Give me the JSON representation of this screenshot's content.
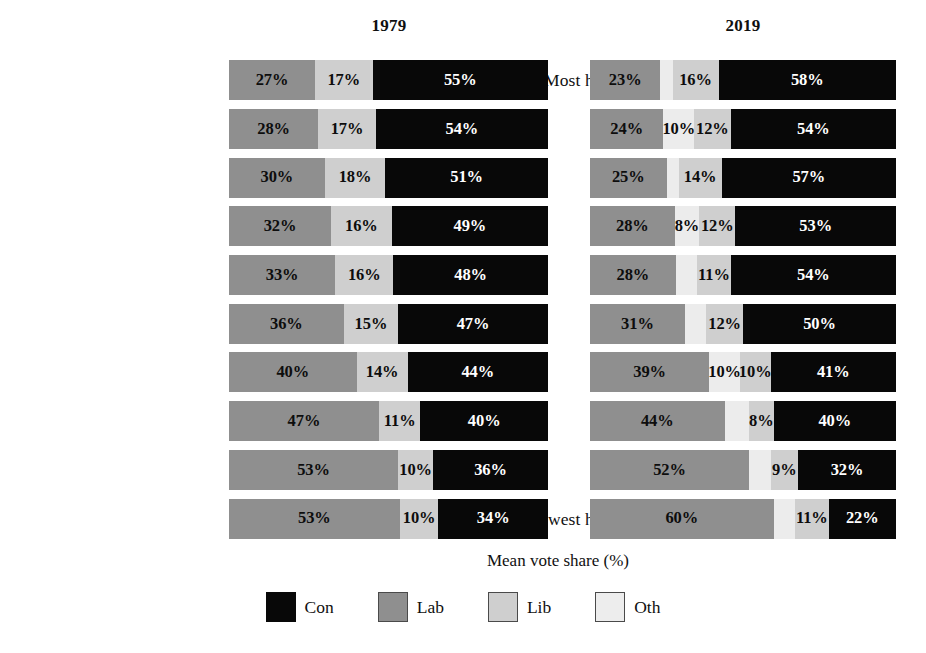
{
  "chart_data": {
    "type": "bar",
    "subtype": "stacked-horizontal-100pct",
    "title": "",
    "xlabel": "Mean vote share (%)",
    "ylabel": "",
    "xlim": [
      0,
      100
    ],
    "grid": false,
    "legend_position": "bottom",
    "panels": [
      {
        "id": "p1979",
        "label": "1979"
      },
      {
        "id": "p2019",
        "label": "2019"
      }
    ],
    "series": [
      {
        "name": "Con",
        "key": "con",
        "color": "#080808"
      },
      {
        "name": "Lab",
        "key": "lab",
        "color": "#8f8f8f"
      },
      {
        "name": "Lib",
        "key": "lib",
        "color": "#cfcfcf"
      },
      {
        "name": "Oth",
        "key": "oth",
        "color": "#ececec"
      }
    ],
    "y_axis_labels": {
      "top": "Most home owners",
      "bottom": "Fewest home owners"
    },
    "categories": [
      "decile 1 (most home owners)",
      "decile 2",
      "decile 3",
      "decile 4",
      "decile 5",
      "decile 6",
      "decile 7",
      "decile 8",
      "decile 9",
      "decile 10 (fewest home owners)"
    ],
    "rows": [
      {
        "row_label": "Most home owners",
        "p1979": [
          {
            "key": "lab",
            "value": 27,
            "label": "27%",
            "width_pct": 27
          },
          {
            "key": "lib",
            "value": 17,
            "label": "17%",
            "width_pct": 18
          },
          {
            "key": "con",
            "value": 55,
            "label": "55%",
            "width_pct": 55
          }
        ],
        "p2019": [
          {
            "key": "lab",
            "value": 23,
            "label": "23%",
            "width_pct": 23
          },
          {
            "key": "oth",
            "value": 3,
            "label": "",
            "width_pct": 4
          },
          {
            "key": "lib",
            "value": 16,
            "label": "16%",
            "width_pct": 15
          },
          {
            "key": "con",
            "value": 58,
            "label": "58%",
            "width_pct": 58
          }
        ]
      },
      {
        "row_label": "",
        "p1979": [
          {
            "key": "lab",
            "value": 28,
            "label": "28%",
            "width_pct": 28
          },
          {
            "key": "lib",
            "value": 17,
            "label": "17%",
            "width_pct": 18
          },
          {
            "key": "con",
            "value": 54,
            "label": "54%",
            "width_pct": 54
          }
        ],
        "p2019": [
          {
            "key": "lab",
            "value": 24,
            "label": "24%",
            "width_pct": 24
          },
          {
            "key": "oth",
            "value": 10,
            "label": "10%",
            "width_pct": 10
          },
          {
            "key": "lib",
            "value": 12,
            "label": "12%",
            "width_pct": 12
          },
          {
            "key": "con",
            "value": 54,
            "label": "54%",
            "width_pct": 54
          }
        ]
      },
      {
        "row_label": "",
        "p1979": [
          {
            "key": "lab",
            "value": 30,
            "label": "30%",
            "width_pct": 30
          },
          {
            "key": "lib",
            "value": 18,
            "label": "18%",
            "width_pct": 19
          },
          {
            "key": "con",
            "value": 51,
            "label": "51%",
            "width_pct": 51
          }
        ],
        "p2019": [
          {
            "key": "lab",
            "value": 25,
            "label": "25%",
            "width_pct": 25
          },
          {
            "key": "oth",
            "value": 4,
            "label": "",
            "width_pct": 4
          },
          {
            "key": "lib",
            "value": 14,
            "label": "14%",
            "width_pct": 14
          },
          {
            "key": "con",
            "value": 57,
            "label": "57%",
            "width_pct": 57
          }
        ]
      },
      {
        "row_label": "",
        "p1979": [
          {
            "key": "lab",
            "value": 32,
            "label": "32%",
            "width_pct": 32
          },
          {
            "key": "lib",
            "value": 16,
            "label": "16%",
            "width_pct": 19
          },
          {
            "key": "con",
            "value": 49,
            "label": "49%",
            "width_pct": 49
          }
        ],
        "p2019": [
          {
            "key": "lab",
            "value": 28,
            "label": "28%",
            "width_pct": 28
          },
          {
            "key": "oth",
            "value": 8,
            "label": "8%",
            "width_pct": 8
          },
          {
            "key": "lib",
            "value": 12,
            "label": "12%",
            "width_pct": 12
          },
          {
            "key": "con",
            "value": 53,
            "label": "53%",
            "width_pct": 53
          }
        ]
      },
      {
        "row_label": "",
        "p1979": [
          {
            "key": "lab",
            "value": 33,
            "label": "33%",
            "width_pct": 33
          },
          {
            "key": "lib",
            "value": 16,
            "label": "16%",
            "width_pct": 18
          },
          {
            "key": "con",
            "value": 48,
            "label": "48%",
            "width_pct": 48
          }
        ],
        "p2019": [
          {
            "key": "lab",
            "value": 28,
            "label": "28%",
            "width_pct": 28
          },
          {
            "key": "oth",
            "value": 7,
            "label": "",
            "width_pct": 7
          },
          {
            "key": "lib",
            "value": 11,
            "label": "11%",
            "width_pct": 11
          },
          {
            "key": "con",
            "value": 54,
            "label": "54%",
            "width_pct": 54
          }
        ]
      },
      {
        "row_label": "",
        "p1979": [
          {
            "key": "lab",
            "value": 36,
            "label": "36%",
            "width_pct": 36
          },
          {
            "key": "lib",
            "value": 15,
            "label": "15%",
            "width_pct": 17
          },
          {
            "key": "con",
            "value": 47,
            "label": "47%",
            "width_pct": 47
          }
        ],
        "p2019": [
          {
            "key": "lab",
            "value": 31,
            "label": "31%",
            "width_pct": 31
          },
          {
            "key": "oth",
            "value": 7,
            "label": "",
            "width_pct": 7
          },
          {
            "key": "lib",
            "value": 12,
            "label": "12%",
            "width_pct": 12
          },
          {
            "key": "con",
            "value": 50,
            "label": "50%",
            "width_pct": 50
          }
        ]
      },
      {
        "row_label": "",
        "p1979": [
          {
            "key": "lab",
            "value": 40,
            "label": "40%",
            "width_pct": 40
          },
          {
            "key": "lib",
            "value": 14,
            "label": "14%",
            "width_pct": 16
          },
          {
            "key": "con",
            "value": 44,
            "label": "44%",
            "width_pct": 44
          }
        ],
        "p2019": [
          {
            "key": "lab",
            "value": 39,
            "label": "39%",
            "width_pct": 39
          },
          {
            "key": "oth",
            "value": 10,
            "label": "10%",
            "width_pct": 10
          },
          {
            "key": "lib",
            "value": 10,
            "label": "10%",
            "width_pct": 10
          },
          {
            "key": "con",
            "value": 41,
            "label": "41%",
            "width_pct": 41
          }
        ]
      },
      {
        "row_label": "",
        "p1979": [
          {
            "key": "lab",
            "value": 47,
            "label": "47%",
            "width_pct": 47
          },
          {
            "key": "lib",
            "value": 11,
            "label": "11%",
            "width_pct": 13
          },
          {
            "key": "con",
            "value": 40,
            "label": "40%",
            "width_pct": 40
          }
        ],
        "p2019": [
          {
            "key": "lab",
            "value": 44,
            "label": "44%",
            "width_pct": 44
          },
          {
            "key": "oth",
            "value": 8,
            "label": "",
            "width_pct": 8
          },
          {
            "key": "lib",
            "value": 8,
            "label": "8%",
            "width_pct": 8
          },
          {
            "key": "con",
            "value": 40,
            "label": "40%",
            "width_pct": 40
          }
        ]
      },
      {
        "row_label": "",
        "p1979": [
          {
            "key": "lab",
            "value": 53,
            "label": "53%",
            "width_pct": 53
          },
          {
            "key": "lib",
            "value": 10,
            "label": "10%",
            "width_pct": 11
          },
          {
            "key": "con",
            "value": 36,
            "label": "36%",
            "width_pct": 36
          }
        ],
        "p2019": [
          {
            "key": "lab",
            "value": 52,
            "label": "52%",
            "width_pct": 52
          },
          {
            "key": "oth",
            "value": 7,
            "label": "",
            "width_pct": 7
          },
          {
            "key": "lib",
            "value": 9,
            "label": "9%",
            "width_pct": 9
          },
          {
            "key": "con",
            "value": 32,
            "label": "32%",
            "width_pct": 32
          }
        ]
      },
      {
        "row_label": "Fewest home owners",
        "p1979": [
          {
            "key": "lab",
            "value": 53,
            "label": "53%",
            "width_pct": 53
          },
          {
            "key": "lib",
            "value": 10,
            "label": "10%",
            "width_pct": 12
          },
          {
            "key": "con",
            "value": 34,
            "label": "34%",
            "width_pct": 34
          }
        ],
        "p2019": [
          {
            "key": "lab",
            "value": 60,
            "label": "60%",
            "width_pct": 60
          },
          {
            "key": "oth",
            "value": 7,
            "label": "",
            "width_pct": 7
          },
          {
            "key": "lib",
            "value": 11,
            "label": "11%",
            "width_pct": 11
          },
          {
            "key": "con",
            "value": 22,
            "label": "22%",
            "width_pct": 22
          }
        ]
      }
    ],
    "legend": [
      {
        "label": "Con",
        "key": "con"
      },
      {
        "label": "Lab",
        "key": "lab"
      },
      {
        "label": "Lib",
        "key": "lib"
      },
      {
        "label": "Oth",
        "key": "oth"
      }
    ]
  }
}
